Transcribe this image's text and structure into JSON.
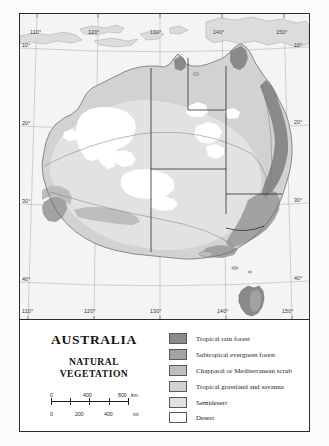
{
  "title": "AUSTRALIA",
  "subtitle_line1": "NATURAL",
  "subtitle_line2": "VEGETATION",
  "graticule": {
    "longitude_labels_top": [
      "110°",
      "120°",
      "130°",
      "140°",
      "150°"
    ],
    "longitude_labels_bottom": [
      "110°",
      "120°",
      "130°",
      "140°",
      "150°"
    ],
    "latitude_labels_left": [
      "10°",
      "20°",
      "30°",
      "40°"
    ],
    "latitude_labels_right": [
      "10°",
      "20°",
      "30°",
      "40°"
    ],
    "lon_top": {
      "l110": "110°",
      "l120": "120°",
      "l130": "130°",
      "l140": "140°",
      "l150": "150°"
    },
    "lon_bottom": {
      "l110": "110°",
      "l120": "120°",
      "l130": "130°",
      "l140": "140°",
      "l150": "150°"
    },
    "lat_left": {
      "l10": "10°",
      "l20": "20°",
      "l30": "30°",
      "l40": "40°"
    },
    "lat_right": {
      "l10": "10°",
      "l20": "20°",
      "l30": "30°",
      "l40": "40°"
    }
  },
  "scale": {
    "km": {
      "unit": "km",
      "ticks": [
        "0",
        "400",
        "800"
      ]
    },
    "mi": {
      "unit": "mi",
      "ticks": [
        "0",
        "200",
        "400"
      ]
    },
    "km_0": "0",
    "km_400": "400",
    "km_800": "800",
    "km_unit": "km",
    "mi_0": "0",
    "mi_200": "200",
    "mi_400": "400",
    "mi_unit": "mi"
  },
  "legend": {
    "items": [
      {
        "label": "Tropical rain forest",
        "color": "#8a8a8a"
      },
      {
        "label": "Subtropical evergreen forest",
        "color": "#a2a2a2"
      },
      {
        "label": "Chapparal or Mediterranean scrub",
        "color": "#bdbdbd"
      },
      {
        "label": "Tropical grassland and savanna",
        "color": "#d2d2d2"
      },
      {
        "label": "Semidesert",
        "color": "#e2e2e2"
      },
      {
        "label": "Desert",
        "color": "#ffffff"
      }
    ]
  },
  "map_colors": {
    "ocean": "#f4f4f2",
    "tropical_rain_forest": "#8a8a8a",
    "subtropical_evergreen_forest": "#a2a2a2",
    "chapparal": "#bdbdbd",
    "tropical_grassland_savanna": "#d2d2d2",
    "semidesert": "#e2e2e2",
    "desert": "#ffffff",
    "coastline": "#6b6b6b",
    "border_line": "#2c2c2c",
    "graticule_line": "#9a9a9a"
  }
}
